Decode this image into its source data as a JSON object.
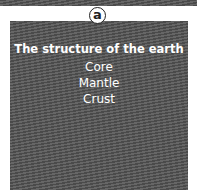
{
  "badge": {
    "label": "a"
  },
  "panel": {
    "title": "The structure of the earth",
    "items": [
      "Core",
      "Mantle",
      "Crust"
    ]
  }
}
